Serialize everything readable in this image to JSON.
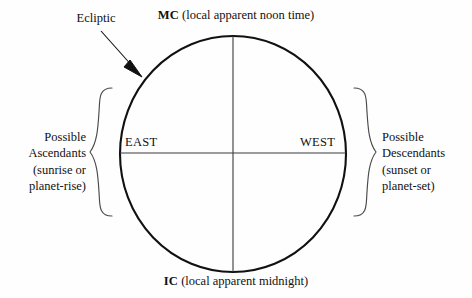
{
  "figure": {
    "background_color": "#fefefe",
    "line_color": "#111111"
  },
  "annotations": {
    "ecliptic": {
      "label": "Ecliptic",
      "pointer_icon": "arrow-icon"
    },
    "mc": {
      "code": "MC",
      "description": " (local apparent noon time)"
    },
    "ic": {
      "code": "IC",
      "description": " (local apparent midnight)"
    },
    "east": {
      "label": "EAST"
    },
    "west": {
      "label": "WEST"
    }
  },
  "side_labels": {
    "left": {
      "lines": [
        "Possible",
        "Ascendants",
        "(sunrise or",
        "planet-rise)"
      ],
      "brace_icon": "left-curly-brace-icon"
    },
    "right": {
      "lines": [
        "Possible",
        "Descendants",
        "(sunset or",
        "planet-set)"
      ],
      "brace_icon": "right-curly-brace-icon"
    }
  },
  "geometry": {
    "circle_center_x": 233,
    "circle_center_y": 154,
    "circle_radius_x": 113,
    "circle_radius_y": 118
  }
}
